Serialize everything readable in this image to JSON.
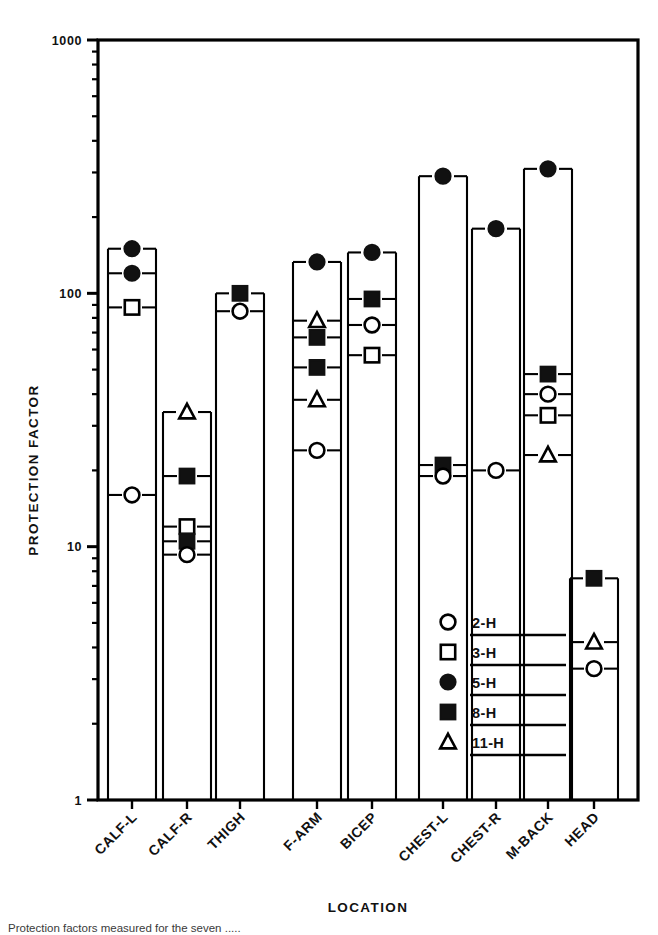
{
  "figure": {
    "title": "",
    "x_axis_label": "LOCATION",
    "y_axis_label": "PROTECTION FACTOR",
    "caption": "Protection factors measured for the seven ....."
  },
  "axis": {
    "y_ticks": [
      "1000",
      "100",
      "10",
      "1"
    ],
    "y_tick_values": [
      1000,
      100,
      10,
      1
    ],
    "y_min": 1,
    "y_max": 1000,
    "scale": "log",
    "grid": false
  },
  "legend": {
    "position": "inside-lower-right",
    "entries": [
      {
        "label": "2-H",
        "marker": "open-circle"
      },
      {
        "label": "3-H",
        "marker": "open-square"
      },
      {
        "label": "5-H",
        "marker": "filled-circle"
      },
      {
        "label": "8-H",
        "marker": "filled-square"
      },
      {
        "label": "11-H",
        "marker": "open-triangle"
      }
    ]
  },
  "chart_data": {
    "type": "scatter",
    "title": "",
    "xlabel": "LOCATION",
    "ylabel": "PROTECTION FACTOR",
    "yscale": "log",
    "ylim": [
      1,
      1000
    ],
    "categories": [
      "CALF-L",
      "CALF-R",
      "THIGH",
      "F-ARM",
      "BICEP",
      "CHEST-L",
      "CHEST-R",
      "M-BACK",
      "HEAD"
    ],
    "series": [
      {
        "name": "2-H",
        "marker": "open-circle",
        "points": [
          {
            "category": "CALF-L",
            "value": 16
          },
          {
            "category": "CALF-R",
            "value": 9.3
          },
          {
            "category": "THIGH",
            "value": 85
          },
          {
            "category": "F-ARM",
            "value": 24
          },
          {
            "category": "BICEP",
            "value": 75
          },
          {
            "category": "CHEST-L",
            "value": 19
          },
          {
            "category": "CHEST-R",
            "value": 20
          },
          {
            "category": "M-BACK",
            "value": 40
          },
          {
            "category": "HEAD",
            "value": 3.3
          }
        ]
      },
      {
        "name": "3-H",
        "marker": "open-square",
        "points": [
          {
            "category": "CALF-L",
            "value": 88
          },
          {
            "category": "CALF-R",
            "value": 12
          },
          {
            "category": "BICEP",
            "value": 57
          },
          {
            "category": "M-BACK",
            "value": 33
          }
        ]
      },
      {
        "name": "5-H",
        "marker": "filled-circle",
        "points": [
          {
            "category": "CALF-L",
            "value": 150
          },
          {
            "category": "CALF-L",
            "value": 120
          },
          {
            "category": "F-ARM",
            "value": 133
          },
          {
            "category": "BICEP",
            "value": 145
          },
          {
            "category": "CHEST-L",
            "value": 290
          },
          {
            "category": "CHEST-R",
            "value": 180
          },
          {
            "category": "M-BACK",
            "value": 310
          }
        ]
      },
      {
        "name": "8-H",
        "marker": "filled-square",
        "points": [
          {
            "category": "CALF-R",
            "value": 19
          },
          {
            "category": "CALF-R",
            "value": 10.5
          },
          {
            "category": "THIGH",
            "value": 100
          },
          {
            "category": "F-ARM",
            "value": 67
          },
          {
            "category": "F-ARM",
            "value": 51
          },
          {
            "category": "BICEP",
            "value": 95
          },
          {
            "category": "CHEST-L",
            "value": 21
          },
          {
            "category": "M-BACK",
            "value": 48
          },
          {
            "category": "HEAD",
            "value": 7.5
          }
        ]
      },
      {
        "name": "11-H",
        "marker": "open-triangle",
        "points": [
          {
            "category": "CALF-R",
            "value": 34
          },
          {
            "category": "F-ARM",
            "value": 78
          },
          {
            "category": "F-ARM",
            "value": 38
          },
          {
            "category": "M-BACK",
            "value": 23
          },
          {
            "category": "HEAD",
            "value": 4.2
          }
        ]
      }
    ]
  },
  "colors": {
    "ink": "#000000",
    "paper": "#ffffff",
    "caption": "#3a3a3a"
  }
}
